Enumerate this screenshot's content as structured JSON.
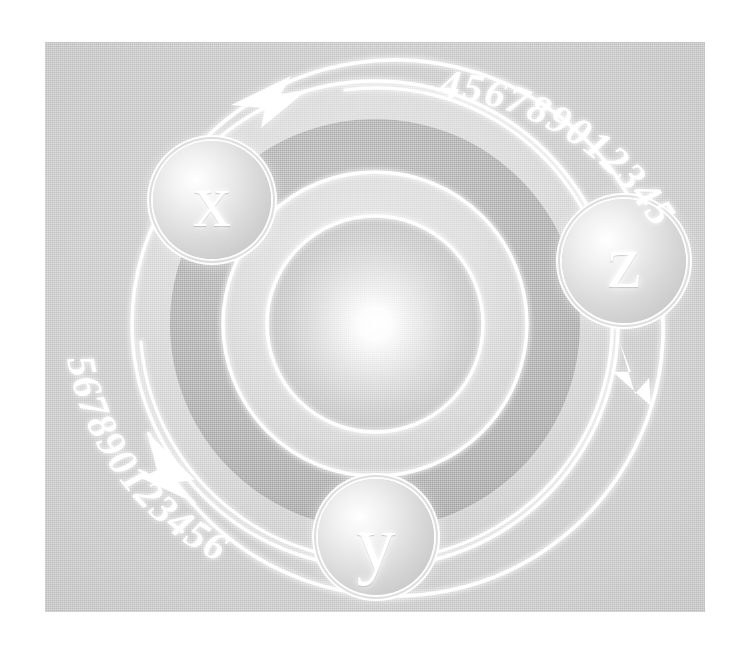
{
  "artwork": {
    "title": "Concentric Orbit Diagram",
    "background_color": "#ffffff",
    "panel_color": "#c6c6c6",
    "accent_color": "#ffffff",
    "dark_band_color": "#a8a8a8"
  },
  "badges": [
    {
      "id": "x",
      "label": "x",
      "position": "top-left"
    },
    {
      "id": "z",
      "label": "z",
      "position": "right"
    },
    {
      "id": "y",
      "label": "y",
      "position": "bottom-center"
    }
  ],
  "digit_arcs": [
    {
      "id": "top-right",
      "text": "456789012345"
    },
    {
      "id": "bottom-left",
      "text": "567890123456"
    }
  ],
  "arrows": [
    {
      "id": "top-arrow",
      "direction": "clockwise",
      "head": "right"
    },
    {
      "id": "right-arrow",
      "direction": "clockwise",
      "head": "down"
    },
    {
      "id": "bottom-left-arrow",
      "direction": "counter-clockwise",
      "head": "up-right"
    }
  ],
  "rings": [
    {
      "id": "ring-outer-arc",
      "radius": 268,
      "stroke": "#ffffff"
    },
    {
      "id": "ring-band-outer",
      "radius": 232,
      "fill": "#d2d2d2"
    },
    {
      "id": "ring-band-dark",
      "radius": 196,
      "fill": "#a8a8a8"
    },
    {
      "id": "ring-mid",
      "radius": 150,
      "stroke": "#ffffff"
    },
    {
      "id": "ring-inner",
      "radius": 104,
      "stroke": "#ffffff"
    },
    {
      "id": "core-glow",
      "radius": 100,
      "fill": "radial-white"
    }
  ]
}
